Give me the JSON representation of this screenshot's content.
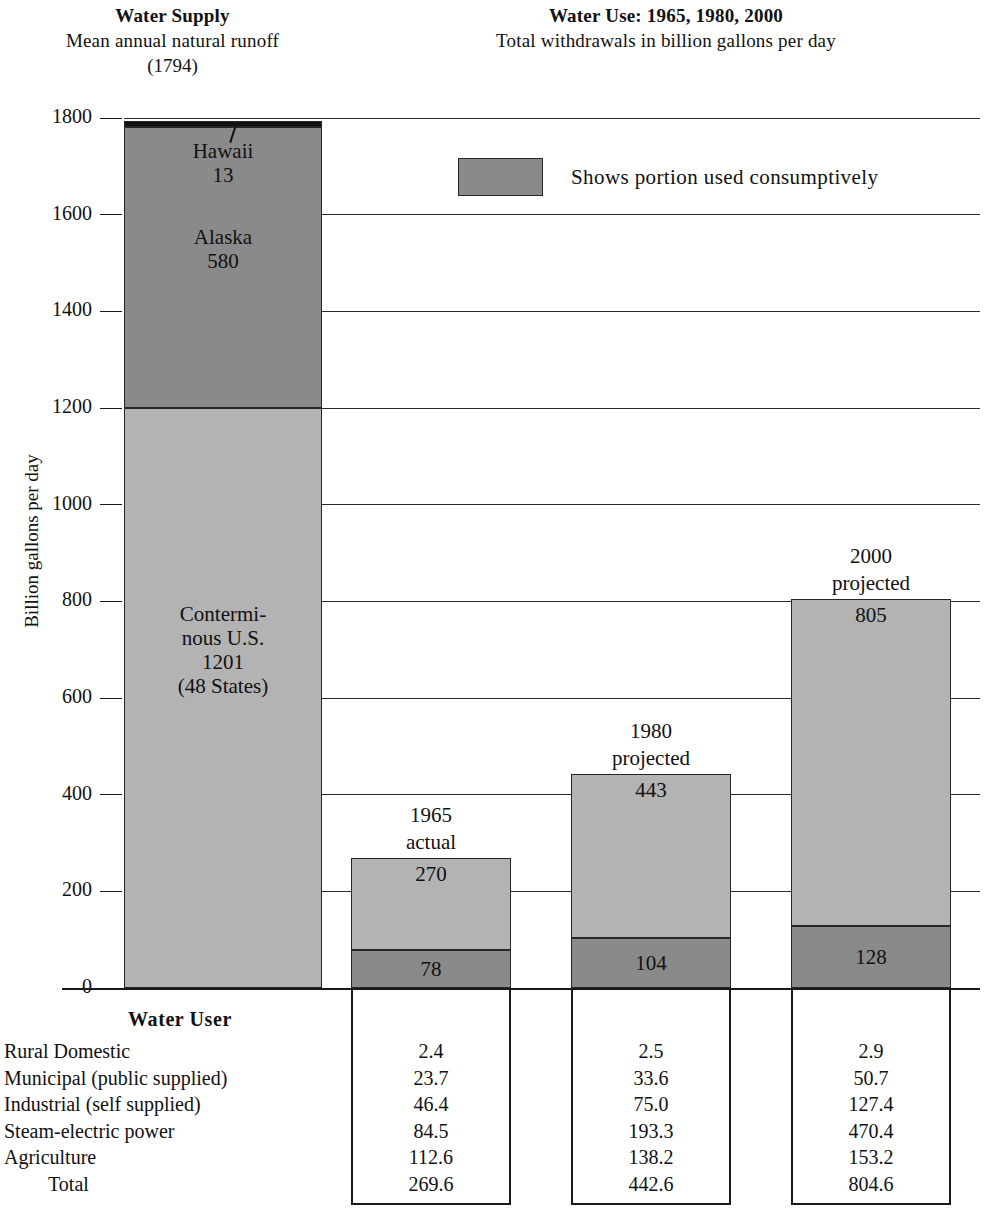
{
  "supply_panel": {
    "title": "Water Supply",
    "subtitle": "Mean  annual  natural  runoff",
    "subtitle2": "(1794)"
  },
  "use_panel": {
    "title": "Water Use: 1965, 1980, 2000",
    "subtitle": "Total withdrawals in billion gallons per day"
  },
  "legend": {
    "text": "Shows  portion  used  consumptively",
    "swatch_color": "#8a8a8a"
  },
  "axis": {
    "y_title": "Billion gallons per day",
    "ticks": [
      "1800",
      "1600",
      "1400",
      "1200",
      "1000",
      "800",
      "600",
      "400",
      "200",
      "0"
    ],
    "y_min": 0,
    "y_max": 1800,
    "y_step": 200
  },
  "table": {
    "header": "Water  User",
    "rows": [
      {
        "label": "Rural Domestic",
        "values": [
          "2.4",
          "2.5",
          "2.9"
        ]
      },
      {
        "label": "Municipal (public supplied)",
        "values": [
          "23.7",
          "33.6",
          "50.7"
        ]
      },
      {
        "label": "Industrial (self supplied)",
        "values": [
          "46.4",
          "75.0",
          "127.4"
        ]
      },
      {
        "label": "Steam-electric power",
        "values": [
          "84.5",
          "193.3",
          "470.4"
        ]
      },
      {
        "label": "Agriculture",
        "values": [
          "112.6",
          "138.2",
          "153.2"
        ]
      },
      {
        "label": "Total",
        "values": [
          "269.6",
          "442.6",
          "804.6"
        ],
        "indent": true
      }
    ]
  },
  "chart_data": {
    "type": "bar",
    "xlabel": "",
    "ylabel": "Billion gallons per day",
    "ylim": [
      0,
      1800
    ],
    "ytick_step": 200,
    "grid": true,
    "legend_position": "top-center",
    "bars": [
      {
        "name": "Water Supply",
        "caption": "",
        "total": 1794,
        "stacked": true,
        "segments": [
          {
            "label": "Contermi-\nnous U.S.\n1201\n(48  States)",
            "name": "Conterminous U.S. (48 States)",
            "value": 1201,
            "color": "#b3b3b3"
          },
          {
            "label": "Alaska\n580",
            "name": "Alaska",
            "value": 580,
            "color": "#8a8a8a"
          },
          {
            "label": "Hawaii\n13",
            "name": "Hawaii",
            "value": 13,
            "color": "#111111"
          }
        ]
      },
      {
        "name": "1965 actual",
        "caption": "1965\nactual",
        "total": 270,
        "stacked": true,
        "segments": [
          {
            "label": "78",
            "name": "consumptive",
            "value": 78,
            "color": "#8a8a8a"
          },
          {
            "label": "270",
            "name": "withdrawal",
            "value": 192,
            "color": "#b3b3b3"
          }
        ]
      },
      {
        "name": "1980 projected",
        "caption": "1980\nprojected",
        "total": 443,
        "stacked": true,
        "segments": [
          {
            "label": "104",
            "name": "consumptive",
            "value": 104,
            "color": "#8a8a8a"
          },
          {
            "label": "443",
            "name": "withdrawal",
            "value": 339,
            "color": "#b3b3b3"
          }
        ]
      },
      {
        "name": "2000 projected",
        "caption": "2000\nprojected",
        "total": 805,
        "stacked": true,
        "segments": [
          {
            "label": "128",
            "name": "consumptive",
            "value": 128,
            "color": "#8a8a8a"
          },
          {
            "label": "805",
            "name": "withdrawal",
            "value": 677,
            "color": "#b3b3b3"
          }
        ]
      }
    ],
    "table": {
      "row_header": "Water  User",
      "columns": [
        "1965 actual",
        "1980 projected",
        "2000 projected"
      ],
      "categories": [
        "Rural Domestic",
        "Municipal (public supplied)",
        "Industrial (self supplied)",
        "Steam-electric power",
        "Agriculture",
        "Total"
      ],
      "series": [
        {
          "name": "1965 actual",
          "values": [
            2.4,
            23.7,
            46.4,
            84.5,
            112.6,
            269.6
          ]
        },
        {
          "name": "1980 projected",
          "values": [
            2.5,
            33.6,
            75.0,
            193.3,
            138.2,
            442.6
          ]
        },
        {
          "name": "2000 projected",
          "values": [
            2.9,
            50.7,
            127.4,
            470.4,
            153.2,
            804.6
          ]
        }
      ]
    }
  }
}
